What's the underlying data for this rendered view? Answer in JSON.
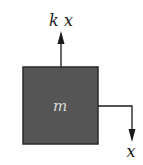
{
  "diagram": {
    "type": "free-body-diagram",
    "mass": {
      "label": "m",
      "fill_color": "#555555",
      "border_color": "#2a2a2a",
      "label_color": "#d9d9d9"
    },
    "forces": [
      {
        "label": "k x",
        "direction": "up",
        "description": "spring force"
      },
      {
        "label": "x",
        "direction": "down",
        "description": "displacement"
      }
    ],
    "line_color": "#1a1a1a"
  }
}
